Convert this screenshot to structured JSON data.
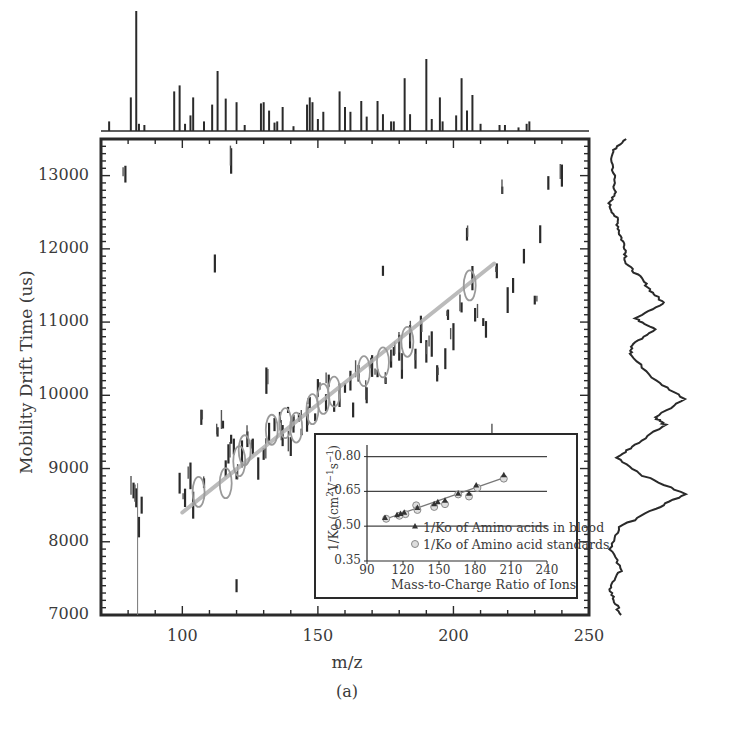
{
  "chart_data": [
    {
      "type": "scatter",
      "title": "",
      "panel_label": "(a)",
      "xlabel": "m/z",
      "ylabel": "Mobility Drift Time (us)",
      "xlim": [
        70,
        250
      ],
      "ylim": [
        7000,
        13500
      ],
      "xticks": [
        100,
        150,
        200,
        250
      ],
      "yticks": [
        7000,
        8000,
        9000,
        10000,
        11000,
        12000,
        13000
      ],
      "xtick_labels": [
        "100",
        "150",
        "200",
        "250"
      ],
      "ytick_labels": [
        "7000",
        "8000",
        "9000",
        "10000",
        "11000",
        "12000",
        "13000"
      ],
      "grid": false,
      "trend_line": {
        "x": [
          100,
          215
        ],
        "y": [
          8400,
          11800
        ],
        "color": "#b0b0b0"
      },
      "circled_points": [
        {
          "x": 106,
          "y": 8680
        },
        {
          "x": 116,
          "y": 8800
        },
        {
          "x": 121,
          "y": 9100
        },
        {
          "x": 123,
          "y": 9250
        },
        {
          "x": 133,
          "y": 9530
        },
        {
          "x": 138,
          "y": 9620
        },
        {
          "x": 142,
          "y": 9560
        },
        {
          "x": 148,
          "y": 9810
        },
        {
          "x": 152,
          "y": 9950
        },
        {
          "x": 156,
          "y": 10050
        },
        {
          "x": 167,
          "y": 10330
        },
        {
          "x": 174,
          "y": 10450
        },
        {
          "x": 183,
          "y": 10730
        },
        {
          "x": 206,
          "y": 11500
        }
      ],
      "features": [
        {
          "x": 79,
          "y": 13020
        },
        {
          "x": 82,
          "y": 8700
        },
        {
          "x": 83,
          "y": 8600
        },
        {
          "x": 84,
          "y": 8200
        },
        {
          "x": 85,
          "y": 8500
        },
        {
          "x": 99,
          "y": 8800
        },
        {
          "x": 101,
          "y": 8600
        },
        {
          "x": 103,
          "y": 8900
        },
        {
          "x": 104,
          "y": 8500
        },
        {
          "x": 107,
          "y": 9700
        },
        {
          "x": 108,
          "y": 8800
        },
        {
          "x": 112,
          "y": 11800
        },
        {
          "x": 113,
          "y": 9500
        },
        {
          "x": 115,
          "y": 9600
        },
        {
          "x": 116,
          "y": 9000
        },
        {
          "x": 117,
          "y": 9200
        },
        {
          "x": 118,
          "y": 9400
        },
        {
          "x": 119,
          "y": 9300
        },
        {
          "x": 120,
          "y": 8900
        },
        {
          "x": 122,
          "y": 9200
        },
        {
          "x": 124,
          "y": 9400
        },
        {
          "x": 126,
          "y": 9300
        },
        {
          "x": 128,
          "y": 9000
        },
        {
          "x": 130,
          "y": 9200
        },
        {
          "x": 131,
          "y": 10200
        },
        {
          "x": 132,
          "y": 9500
        },
        {
          "x": 134,
          "y": 9600
        },
        {
          "x": 136,
          "y": 9700
        },
        {
          "x": 137,
          "y": 9450
        },
        {
          "x": 139,
          "y": 9800
        },
        {
          "x": 140,
          "y": 9300
        },
        {
          "x": 141,
          "y": 9600
        },
        {
          "x": 143,
          "y": 9700
        },
        {
          "x": 144,
          "y": 9500
        },
        {
          "x": 146,
          "y": 9650
        },
        {
          "x": 147,
          "y": 9900
        },
        {
          "x": 149,
          "y": 9700
        },
        {
          "x": 150,
          "y": 10100
        },
        {
          "x": 153,
          "y": 9900
        },
        {
          "x": 154,
          "y": 10200
        },
        {
          "x": 156,
          "y": 9850
        },
        {
          "x": 158,
          "y": 10000
        },
        {
          "x": 160,
          "y": 10100
        },
        {
          "x": 162,
          "y": 10200
        },
        {
          "x": 163,
          "y": 9800
        },
        {
          "x": 165,
          "y": 10300
        },
        {
          "x": 168,
          "y": 10000
        },
        {
          "x": 170,
          "y": 10400
        },
        {
          "x": 172,
          "y": 10300
        },
        {
          "x": 174,
          "y": 11700
        },
        {
          "x": 175,
          "y": 10200
        },
        {
          "x": 177,
          "y": 10500
        },
        {
          "x": 178,
          "y": 10600
        },
        {
          "x": 180,
          "y": 10650
        },
        {
          "x": 181,
          "y": 10400
        },
        {
          "x": 184,
          "y": 10800
        },
        {
          "x": 186,
          "y": 10500
        },
        {
          "x": 188,
          "y": 10900
        },
        {
          "x": 190,
          "y": 10600
        },
        {
          "x": 192,
          "y": 10700
        },
        {
          "x": 194,
          "y": 10300
        },
        {
          "x": 197,
          "y": 10500
        },
        {
          "x": 198,
          "y": 11100
        },
        {
          "x": 200,
          "y": 10800
        },
        {
          "x": 203,
          "y": 11200
        },
        {
          "x": 205,
          "y": 12200
        },
        {
          "x": 207,
          "y": 11600
        },
        {
          "x": 208,
          "y": 11100
        },
        {
          "x": 211,
          "y": 11000
        },
        {
          "x": 212,
          "y": 10900
        },
        {
          "x": 216,
          "y": 11700
        },
        {
          "x": 218,
          "y": 12800
        },
        {
          "x": 220,
          "y": 11300
        },
        {
          "x": 222,
          "y": 11500
        },
        {
          "x": 226,
          "y": 11900
        },
        {
          "x": 230,
          "y": 11300
        },
        {
          "x": 232,
          "y": 12200
        },
        {
          "x": 235,
          "y": 12900
        },
        {
          "x": 240,
          "y": 13000
        },
        {
          "x": 118,
          "y": 13200
        },
        {
          "x": 210,
          "y": 9200
        },
        {
          "x": 214,
          "y": 9400
        },
        {
          "x": 168,
          "y": 9300
        },
        {
          "x": 120,
          "y": 7400
        }
      ],
      "marginal_top": {
        "type": "spectrum",
        "peaks": [
          {
            "x": 73,
            "h": 0.08
          },
          {
            "x": 81,
            "h": 0.28
          },
          {
            "x": 83,
            "h": 1.0
          },
          {
            "x": 84,
            "h": 0.06
          },
          {
            "x": 86,
            "h": 0.05
          },
          {
            "x": 97,
            "h": 0.33
          },
          {
            "x": 99,
            "h": 0.38
          },
          {
            "x": 101,
            "h": 0.06
          },
          {
            "x": 103,
            "h": 0.13
          },
          {
            "x": 104,
            "h": 0.28
          },
          {
            "x": 108,
            "h": 0.08
          },
          {
            "x": 111,
            "h": 0.22
          },
          {
            "x": 113,
            "h": 0.5
          },
          {
            "x": 116,
            "h": 0.27
          },
          {
            "x": 120,
            "h": 0.24
          },
          {
            "x": 123,
            "h": 0.05
          },
          {
            "x": 129,
            "h": 0.23
          },
          {
            "x": 130,
            "h": 0.24
          },
          {
            "x": 132,
            "h": 0.17
          },
          {
            "x": 134,
            "h": 0.07
          },
          {
            "x": 135,
            "h": 0.08
          },
          {
            "x": 137,
            "h": 0.2
          },
          {
            "x": 141,
            "h": 0.04
          },
          {
            "x": 146,
            "h": 0.22
          },
          {
            "x": 147,
            "h": 0.28
          },
          {
            "x": 148,
            "h": 0.24
          },
          {
            "x": 150,
            "h": 0.1
          },
          {
            "x": 152,
            "h": 0.16
          },
          {
            "x": 158,
            "h": 0.33
          },
          {
            "x": 160,
            "h": 0.2
          },
          {
            "x": 162,
            "h": 0.16
          },
          {
            "x": 166,
            "h": 0.25
          },
          {
            "x": 168,
            "h": 0.12
          },
          {
            "x": 172,
            "h": 0.25
          },
          {
            "x": 174,
            "h": 0.14
          },
          {
            "x": 177,
            "h": 0.08
          },
          {
            "x": 178,
            "h": 0.08
          },
          {
            "x": 182,
            "h": 0.44
          },
          {
            "x": 184,
            "h": 0.14
          },
          {
            "x": 190,
            "h": 0.6
          },
          {
            "x": 192,
            "h": 0.1
          },
          {
            "x": 195,
            "h": 0.28
          },
          {
            "x": 196,
            "h": 0.08
          },
          {
            "x": 201,
            "h": 0.13
          },
          {
            "x": 203,
            "h": 0.44
          },
          {
            "x": 205,
            "h": 0.17
          },
          {
            "x": 207,
            "h": 0.3
          },
          {
            "x": 210,
            "h": 0.06
          },
          {
            "x": 217,
            "h": 0.05
          },
          {
            "x": 219,
            "h": 0.05
          },
          {
            "x": 224,
            "h": 0.03
          },
          {
            "x": 227,
            "h": 0.06
          },
          {
            "x": 228,
            "h": 0.08
          }
        ]
      },
      "marginal_right": {
        "type": "profile",
        "note": "summed intensity vs drift time; major maxima near 8650 us and 9900 us, secondary near 10550 and 11250 us",
        "points": [
          {
            "y": 13500,
            "v": 0.28
          },
          {
            "y": 13300,
            "v": 0.05
          },
          {
            "y": 13000,
            "v": 0.1
          },
          {
            "y": 12800,
            "v": 0.12
          },
          {
            "y": 12600,
            "v": 0.02
          },
          {
            "y": 12400,
            "v": 0.15
          },
          {
            "y": 12200,
            "v": 0.2
          },
          {
            "y": 12000,
            "v": 0.3
          },
          {
            "y": 11800,
            "v": 0.3
          },
          {
            "y": 11600,
            "v": 0.55
          },
          {
            "y": 11400,
            "v": 0.75
          },
          {
            "y": 11250,
            "v": 0.95
          },
          {
            "y": 11050,
            "v": 0.45
          },
          {
            "y": 10900,
            "v": 0.82
          },
          {
            "y": 10700,
            "v": 0.4
          },
          {
            "y": 10550,
            "v": 0.38
          },
          {
            "y": 10200,
            "v": 0.8
          },
          {
            "y": 9950,
            "v": 1.3
          },
          {
            "y": 9700,
            "v": 0.8
          },
          {
            "y": 9600,
            "v": 0.95
          },
          {
            "y": 9350,
            "v": 0.5
          },
          {
            "y": 9150,
            "v": 0.15
          },
          {
            "y": 8900,
            "v": 0.6
          },
          {
            "y": 8650,
            "v": 1.3
          },
          {
            "y": 8450,
            "v": 0.8
          },
          {
            "y": 8200,
            "v": 0.2
          },
          {
            "y": 7900,
            "v": 0.05
          },
          {
            "y": 7600,
            "v": 0.22
          },
          {
            "y": 7400,
            "v": 0.02
          },
          {
            "y": 7200,
            "v": 0.1
          },
          {
            "y": 7000,
            "v": 0.22
          }
        ]
      }
    },
    {
      "type": "scatter",
      "title": "inset",
      "xlabel": "Mass-to-Charge Ratio of Ions",
      "ylabel": "1/Ko (cm²V⁻¹s⁻¹)",
      "ylabel_parts": {
        "base": "1/Ko (cm",
        "sup1": "2",
        "mid1": "V",
        "sup2": "−1",
        "mid2": "s",
        "sup3": "−1",
        "end": ")"
      },
      "xlim": [
        90,
        240
      ],
      "ylim": [
        0.35,
        0.85
      ],
      "xticks": [
        90,
        120,
        150,
        180,
        210,
        240
      ],
      "yticks": [
        0.35,
        0.5,
        0.65,
        0.8
      ],
      "xtick_labels": [
        "90",
        "120",
        "150",
        "180",
        "210",
        "240"
      ],
      "ytick_labels": [
        "0.35",
        "0.50",
        "0.65",
        "0.80"
      ],
      "grid": "horizontal at 0.50, 0.65, 0.80",
      "legend": [
        "1/Ko of Amino acids in blood",
        "1/Ko of Amino acid standards"
      ],
      "legend_position": "lower right",
      "series": [
        {
          "name": "1/Ko of Amino acids in blood",
          "marker": "triangle-filled",
          "points": [
            [
              105,
              0.535
            ],
            [
              115,
              0.547
            ],
            [
              118,
              0.553
            ],
            [
              121,
              0.558
            ],
            [
              132,
              0.578
            ],
            [
              146,
              0.595
            ],
            [
              149,
              0.603
            ],
            [
              155,
              0.61
            ],
            [
              166,
              0.64
            ],
            [
              175,
              0.64
            ],
            [
              181,
              0.675
            ],
            [
              204,
              0.72
            ]
          ]
        },
        {
          "name": "1/Ko of Amino acid standards",
          "marker": "circle-open",
          "points": [
            [
              106,
              0.532
            ],
            [
              117,
              0.545
            ],
            [
              122,
              0.552
            ],
            [
              131,
              0.59
            ],
            [
              132,
              0.57
            ],
            [
              146,
              0.583
            ],
            [
              155,
              0.595
            ],
            [
              166,
              0.637
            ],
            [
              175,
              0.628
            ],
            [
              182,
              0.665
            ],
            [
              204,
              0.705
            ]
          ]
        }
      ],
      "trend_line": {
        "x": [
          105,
          205
        ],
        "y": [
          0.53,
          0.71
        ]
      }
    }
  ]
}
